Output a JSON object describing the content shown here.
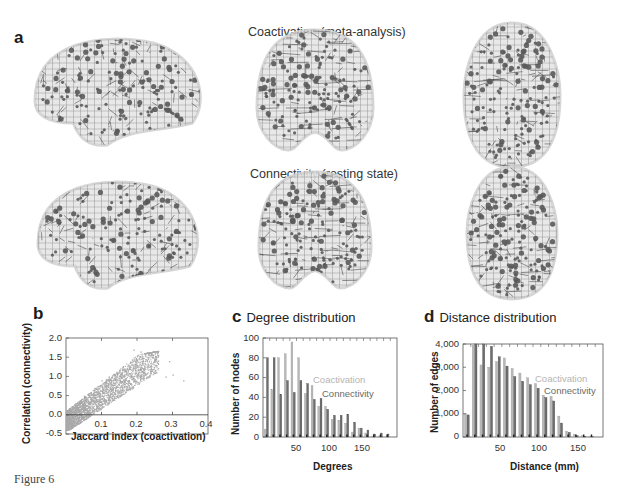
{
  "panel_a": {
    "letter": "a",
    "row_titles": [
      "Coactivation (meta-analysis)",
      "Connectivity (resting state)"
    ],
    "views": [
      "sagittal",
      "coronal",
      "axial"
    ]
  },
  "panel_b": {
    "letter": "b"
  },
  "panel_c": {
    "letter": "c",
    "title": "Degree distribution"
  },
  "panel_d": {
    "letter": "d",
    "title": "Distance distribution"
  },
  "caption": "Figure 6",
  "colors": {
    "coactivation": "#b8b8b8",
    "connectivity": "#6e6e6e",
    "scatter": "#a9a9a9",
    "node": "#5a5a5a",
    "edge": "#444444",
    "brain_fill": "#e6e6e6"
  },
  "chart_data": [
    {
      "panel": "b",
      "type": "scatter",
      "title": "",
      "xlabel": "Jaccard index (coactivation)",
      "ylabel": "Correlation (connectivity)",
      "xlim": [
        0,
        0.4
      ],
      "ylim": [
        -0.5,
        2.0
      ],
      "xticks": [
        "0.1",
        "0.2",
        "0.3",
        "0.4"
      ],
      "yticks": [
        "2.0",
        "1.5",
        "1.0",
        "0.5",
        "0.0",
        "-0.5"
      ],
      "grid": false,
      "description": "Dense cloud of points; correlation rises with Jaccard index. Bulk at x 0–0.15, y -0.3–1.2; sparse tail to x≈0.33, y up to ≈1.7.",
      "sample_points": [
        [
          0.02,
          0.1
        ],
        [
          0.05,
          0.5
        ],
        [
          0.08,
          0.7
        ],
        [
          0.1,
          0.9
        ],
        [
          0.12,
          1.0
        ],
        [
          0.15,
          1.1
        ],
        [
          0.18,
          1.2
        ],
        [
          0.2,
          1.3
        ],
        [
          0.22,
          1.2
        ],
        [
          0.25,
          1.1
        ],
        [
          0.28,
          1.0
        ],
        [
          0.29,
          1.4
        ],
        [
          0.3,
          1.05
        ],
        [
          0.33,
          0.9
        ],
        [
          0.19,
          1.7
        ],
        [
          0.21,
          1.65
        ]
      ]
    },
    {
      "panel": "c",
      "type": "bar",
      "title": "Degree distribution",
      "xlabel": "Degrees",
      "ylabel": "Number of nodes",
      "xlim": [
        0,
        200
      ],
      "ylim": [
        0,
        100
      ],
      "xticks": [
        "50",
        "100",
        "150"
      ],
      "yticks": [
        "100",
        "80",
        "60",
        "40",
        "20",
        "0"
      ],
      "legend": [
        "Coactivation",
        "Connectivity"
      ],
      "legend_position": "inside right",
      "categories": [
        5,
        15,
        25,
        35,
        45,
        55,
        65,
        75,
        85,
        95,
        105,
        115,
        125,
        135,
        145,
        155,
        165,
        175,
        185
      ],
      "series": [
        {
          "name": "Coactivation",
          "values": [
            8,
            48,
            80,
            84,
            96,
            80,
            44,
            52,
            31,
            31,
            18,
            17,
            14,
            5,
            9,
            4,
            1,
            1,
            0
          ]
        },
        {
          "name": "Connectivity",
          "values": [
            80,
            80,
            43,
            57,
            45,
            57,
            54,
            38,
            39,
            28,
            22,
            22,
            23,
            15,
            9,
            7,
            3,
            4,
            3
          ]
        }
      ]
    },
    {
      "panel": "d",
      "type": "bar",
      "title": "Distance distribution",
      "xlabel": "Distance (mm)",
      "ylabel": "Number of edges",
      "xlim": [
        0,
        180
      ],
      "ylim": [
        0,
        4000
      ],
      "xticks": [
        "50",
        "100",
        "150"
      ],
      "yticks": [
        "4,000",
        "3,000",
        "2,000",
        "1,000",
        "0"
      ],
      "legend": [
        "Coactivation",
        "Connectivity"
      ],
      "legend_position": "inside right",
      "categories": [
        5,
        15,
        25,
        35,
        45,
        55,
        65,
        75,
        85,
        95,
        105,
        115,
        125,
        135,
        145,
        155,
        165
      ],
      "series": [
        {
          "name": "Coactivation",
          "values": [
            1000,
            3950,
            3100,
            3000,
            3250,
            3400,
            2950,
            2750,
            2550,
            2300,
            1800,
            1750,
            900,
            250,
            120,
            60,
            30
          ]
        },
        {
          "name": "Connectivity",
          "values": [
            950,
            4200,
            4150,
            3900,
            3450,
            3050,
            2600,
            2400,
            2250,
            2100,
            1700,
            1550,
            600,
            200,
            60,
            30,
            10
          ]
        }
      ]
    }
  ]
}
